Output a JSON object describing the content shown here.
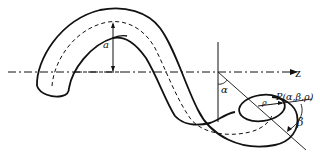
{
  "diagram": {
    "labels": {
      "amplitude": "a",
      "axis": "z",
      "angle_alpha": "α",
      "radial": "ρ",
      "point": "P(α,β,ρ)",
      "angle_beta": "β"
    },
    "colors": {
      "stroke": "#111111",
      "background": "#ffffff"
    }
  }
}
